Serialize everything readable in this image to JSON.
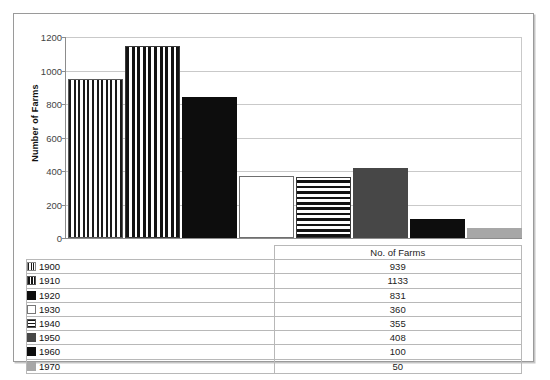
{
  "chart_data": {
    "type": "bar",
    "title": "",
    "xlabel": "No. of Farms",
    "ylabel": "Number of Farms",
    "categories": [
      "1900",
      "1910",
      "1920",
      "1930",
      "1940",
      "1950",
      "1960",
      "1970"
    ],
    "values": [
      939,
      1133,
      831,
      360,
      355,
      408,
      100,
      50
    ],
    "ylim": [
      0,
      1200
    ],
    "y_ticks": [
      0,
      200,
      400,
      600,
      800,
      1000,
      1200
    ],
    "grid": true,
    "legend_position": "table-below",
    "series": [
      {
        "name": "No. of Farms",
        "values": [
          939,
          1133,
          831,
          360,
          355,
          408,
          100,
          50
        ]
      }
    ],
    "bar_styles": [
      "dotted-brick",
      "vertical-stripe",
      "black",
      "white",
      "horizontal-stripe",
      "dark-gray",
      "black",
      "light-gray"
    ]
  },
  "table": {
    "header_value": "No. of Farms",
    "rows": [
      {
        "key": "1900",
        "value": "939",
        "swatch": "dotted-brick"
      },
      {
        "key": "1910",
        "value": "1133",
        "swatch": "vertical-stripe"
      },
      {
        "key": "1920",
        "value": "831",
        "swatch": "black"
      },
      {
        "key": "1930",
        "value": "360",
        "swatch": "white"
      },
      {
        "key": "1940",
        "value": "355",
        "swatch": "horizontal-stripe"
      },
      {
        "key": "1950",
        "value": "408",
        "swatch": "dark-gray"
      },
      {
        "key": "1960",
        "value": "100",
        "swatch": "black"
      },
      {
        "key": "1970",
        "value": "50",
        "swatch": "light-gray"
      }
    ]
  },
  "axis": {
    "y_title": "Number of Farms",
    "y_tick_labels": [
      "1200",
      "1000",
      "800",
      "600",
      "400",
      "200",
      "0"
    ]
  },
  "colors": {
    "black": "#0d0d0d",
    "dark_gray": "#474747",
    "light_gray": "#a7a7a7",
    "white": "#ffffff",
    "gridline": "#c9c9c9",
    "axis": "#8c8c8c",
    "border": "#9a9a9a"
  }
}
